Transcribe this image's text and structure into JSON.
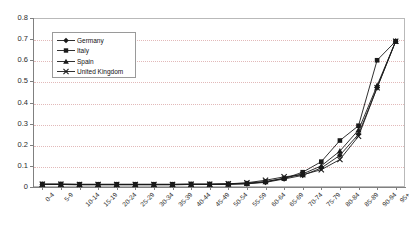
{
  "chart_data": {
    "type": "line",
    "title": "",
    "subtitle": "",
    "xlabel": "",
    "ylabel": "",
    "ylim": [
      0,
      0.8
    ],
    "ytick_step": 0.1,
    "yticks": [
      "0.8",
      "0.7",
      "0.6",
      "0.5",
      "0.4",
      "0.3",
      "0.2",
      "0.1",
      "0"
    ],
    "ytick_values": [
      0.8,
      0.7,
      0.6,
      0.5,
      0.4,
      0.3,
      0.2,
      0.1,
      0
    ],
    "grid": true,
    "grid_style": "dotted-horizontal",
    "grid_color": "#e2b9b9",
    "legend_position": "inside-top-left",
    "categories": [
      "0-4",
      "5-9",
      "10-14",
      "15-19",
      "20-24",
      "25-29",
      "30-34",
      "35-39",
      "40-44",
      "45-49",
      "50-54",
      "55-59",
      "60-64",
      "65-69",
      "70-74",
      "75-79",
      "80-84",
      "85-89",
      "90-94",
      "95+"
    ],
    "series": [
      {
        "name": "Germany",
        "marker": "diamond",
        "color": "#1a1a1a",
        "values": [
          0.012,
          0.012,
          0.011,
          0.011,
          0.011,
          0.011,
          0.011,
          0.011,
          0.012,
          0.012,
          0.013,
          0.015,
          0.022,
          0.038,
          0.055,
          0.09,
          0.15,
          0.25,
          0.47,
          0.69
        ]
      },
      {
        "name": "Italy",
        "marker": "square",
        "color": "#1a1a1a",
        "values": [
          0.014,
          0.014,
          0.013,
          0.013,
          0.013,
          0.013,
          0.013,
          0.013,
          0.014,
          0.014,
          0.015,
          0.018,
          0.026,
          0.04,
          0.07,
          0.12,
          0.22,
          0.29,
          0.6,
          0.69
        ]
      },
      {
        "name": "Spain",
        "marker": "triangle",
        "color": "#1a1a1a",
        "values": [
          0.012,
          0.012,
          0.011,
          0.011,
          0.011,
          0.011,
          0.011,
          0.011,
          0.012,
          0.012,
          0.013,
          0.016,
          0.024,
          0.042,
          0.062,
          0.1,
          0.17,
          0.27,
          0.48,
          0.69
        ]
      },
      {
        "name": "United Kingdom",
        "marker": "cross",
        "color": "#1a1a1a",
        "values": [
          0.013,
          0.013,
          0.012,
          0.012,
          0.012,
          0.012,
          0.012,
          0.012,
          0.013,
          0.013,
          0.015,
          0.02,
          0.032,
          0.048,
          0.058,
          0.082,
          0.13,
          0.24,
          0.47,
          0.69
        ]
      }
    ]
  },
  "legend": {
    "items": [
      {
        "label": "Germany",
        "marker": "diamond"
      },
      {
        "label": "Italy",
        "marker": "square"
      },
      {
        "label": "Spain",
        "marker": "triangle"
      },
      {
        "label": "United Kingdom",
        "marker": "cross"
      }
    ]
  }
}
